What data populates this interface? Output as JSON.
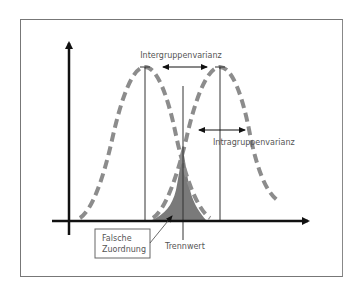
{
  "diagram": {
    "title": "",
    "labels": {
      "intergroup_variance": "Intergruppenvarianz",
      "intragroup_variance": "Intragruppenvarianz",
      "misclassification_line1": "Falsche",
      "misclassification_line2": "Zuordnung",
      "threshold": "Trennwert"
    },
    "elements": {
      "y_axis": "vertical axis arrow",
      "x_axis": "horizontal axis arrow",
      "left_distribution": "dashed bell curve (group 1)",
      "right_distribution": "dashed bell curve (group 2)",
      "overlap_area": "shaded overlap region",
      "threshold_line": "vertical separation line"
    },
    "colors": {
      "curve": "#8c8c8c",
      "axis": "#111111",
      "overlap_fill": "#7a7a7a",
      "frame": "#777777",
      "label_text": "#555555"
    }
  }
}
